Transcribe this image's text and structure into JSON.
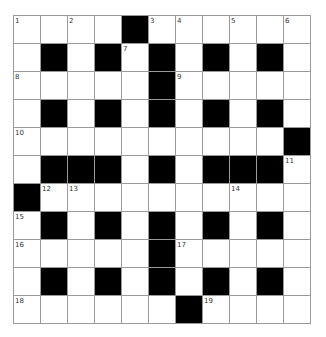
{
  "puzzle": {
    "rows": 11,
    "cols": 11,
    "colors": {
      "block": "#000000",
      "open": "#ffffff",
      "grid_line": "#9a9a9a",
      "number": "#333333"
    },
    "legend": "Grid notation: '#' = black square, '.' = white square, number = numbered white square",
    "grid": [
      [
        "1",
        ".",
        "2",
        ".",
        "#",
        "3",
        "4",
        ".",
        "5",
        ".",
        "6"
      ],
      [
        ".",
        "#",
        ".",
        "#",
        "7",
        "#",
        ".",
        "#",
        ".",
        "#",
        "."
      ],
      [
        "8",
        ".",
        ".",
        ".",
        ".",
        "#",
        "9",
        ".",
        ".",
        ".",
        "."
      ],
      [
        ".",
        "#",
        ".",
        "#",
        ".",
        "#",
        ".",
        "#",
        ".",
        "#",
        "."
      ],
      [
        "10",
        ".",
        ".",
        ".",
        ".",
        ".",
        ".",
        ".",
        ".",
        ".",
        "#"
      ],
      [
        ".",
        "#",
        "#",
        "#",
        ".",
        "#",
        ".",
        "#",
        "#",
        "#",
        "11"
      ],
      [
        "#",
        "12",
        "13",
        ".",
        ".",
        ".",
        ".",
        ".",
        "14",
        ".",
        "."
      ],
      [
        "15",
        "#",
        ".",
        "#",
        ".",
        "#",
        ".",
        "#",
        ".",
        "#",
        "."
      ],
      [
        "16",
        ".",
        ".",
        ".",
        ".",
        "#",
        "17",
        ".",
        ".",
        ".",
        "."
      ],
      [
        ".",
        "#",
        ".",
        "#",
        ".",
        "#",
        ".",
        "#",
        ".",
        "#",
        "."
      ],
      [
        "18",
        ".",
        ".",
        ".",
        ".",
        ".",
        "#",
        "19",
        ".",
        ".",
        "."
      ]
    ]
  }
}
